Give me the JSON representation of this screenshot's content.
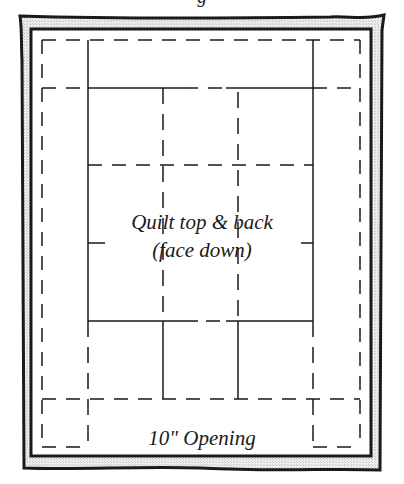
{
  "diagram": {
    "top_caption_fragment": "g",
    "center_label_line1": "Quilt top & back",
    "center_label_line2": "(face down)",
    "opening_label": "10\" Opening",
    "colors": {
      "line": "#1a1a1a",
      "frame_band": "#d9d9d9",
      "background": "#ffffff"
    },
    "frame": {
      "outer": {
        "x": 20,
        "y": 16,
        "w": 364,
        "h": 452
      },
      "inner": {
        "x": 31,
        "y": 29,
        "w": 340,
        "h": 427
      }
    },
    "dashed_border": {
      "left": 42,
      "right": 360,
      "top": 40,
      "bottom": 447,
      "opening_from_x": 88,
      "opening_to_x": 313
    },
    "grid": {
      "outer_verticals_x": [
        88,
        313
      ],
      "inner_verticals_x": [
        163,
        238
      ],
      "top_band_y": 88,
      "middle_dashed_y": 165,
      "center_tick_y": 243,
      "lower_solid_y": 321,
      "bottom_band_y": 399
    }
  }
}
